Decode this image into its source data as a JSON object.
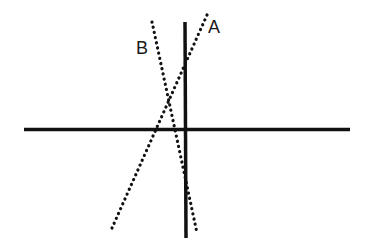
{
  "diagram": {
    "type": "coordinate-axes-with-lines",
    "axes": {
      "horizontal": {
        "x1": 24,
        "y1": 129.5,
        "x2": 350,
        "y2": 129.5,
        "style": "solid",
        "color": "#111111",
        "width": 3.5
      },
      "vertical": {
        "x1": 185,
        "y1": 22,
        "x2": 186,
        "y2": 238,
        "style": "solid",
        "color": "#111111",
        "width": 3.5
      }
    },
    "lines": [
      {
        "id": "A",
        "label": "A",
        "x1": 207,
        "y1": 15,
        "x2": 112,
        "y2": 228,
        "style": "dotted",
        "color": "#111111",
        "label_x": 208,
        "label_y": 33
      },
      {
        "id": "B",
        "label": "B",
        "x1": 152,
        "y1": 22,
        "x2": 197,
        "y2": 233,
        "style": "dotted",
        "color": "#111111",
        "label_x": 136,
        "label_y": 54
      }
    ]
  }
}
